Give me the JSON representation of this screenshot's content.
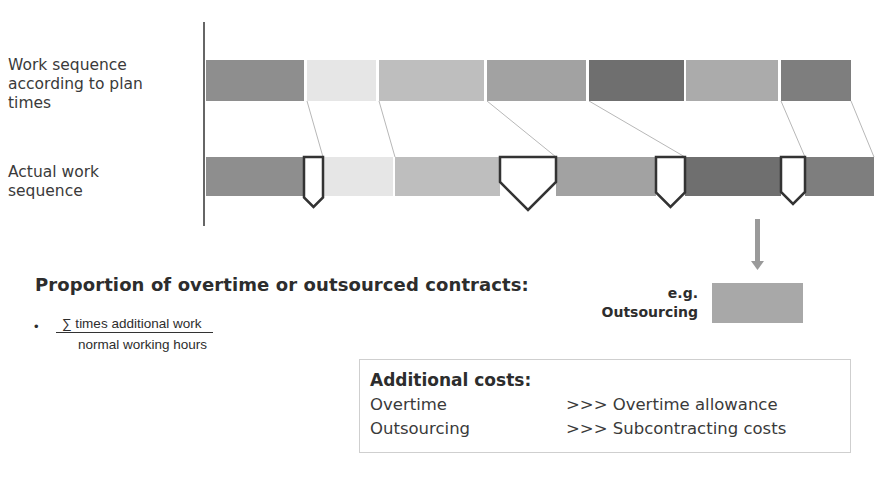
{
  "row_labels": {
    "planned": [
      "Work sequence",
      "according to plan",
      "times"
    ],
    "actual": [
      "Actual work",
      "sequence"
    ]
  },
  "planned_sequence": [
    {
      "x": 206,
      "w": 98,
      "color": "#8e8e8e"
    },
    {
      "x": 307,
      "w": 69,
      "color": "#e6e6e6"
    },
    {
      "x": 379,
      "w": 105,
      "color": "#bebebe"
    },
    {
      "x": 487,
      "w": 99,
      "color": "#a2a2a2"
    },
    {
      "x": 589,
      "w": 95,
      "color": "#6f6f6f"
    },
    {
      "x": 686,
      "w": 92,
      "color": "#ababab"
    },
    {
      "x": 781,
      "w": 70,
      "color": "#7e7e7e"
    }
  ],
  "actual_sequence": [
    {
      "x": 206,
      "w": 98,
      "color": "#8e8e8e"
    },
    {
      "x": 323,
      "w": 70,
      "color": "#e6e6e6"
    },
    {
      "x": 395,
      "w": 105,
      "color": "#bebebe"
    },
    {
      "x": 556,
      "w": 100,
      "color": "#a2a2a2"
    },
    {
      "x": 685,
      "w": 96,
      "color": "#6f6f6f"
    },
    {
      "x": 805,
      "w": 69,
      "color": "#7e7e7e"
    }
  ],
  "additional_work_markers": [
    {
      "x": 304,
      "w": 19,
      "tip": 207
    },
    {
      "x": 500,
      "w": 56,
      "tip": 210
    },
    {
      "x": 656,
      "w": 29,
      "tip": 207
    },
    {
      "x": 781,
      "w": 24,
      "tip": 204
    }
  ],
  "connectors": [
    {
      "x1": 307,
      "y1": 101,
      "x2": 323,
      "y2": 157
    },
    {
      "x1": 379,
      "y1": 101,
      "x2": 395,
      "y2": 157
    },
    {
      "x1": 487,
      "y1": 101,
      "x2": 556,
      "y2": 157
    },
    {
      "x1": 589,
      "y1": 101,
      "x2": 685,
      "y2": 157
    },
    {
      "x1": 781,
      "y1": 101,
      "x2": 805,
      "y2": 157
    },
    {
      "x1": 851,
      "y1": 101,
      "x2": 874,
      "y2": 157
    }
  ],
  "proportion": {
    "heading": "Proportion of overtime or outsourced contracts:",
    "bullet": "•",
    "numerator": "∑ times additional work",
    "denominator": "normal working hours"
  },
  "example": {
    "line1": "e.g.",
    "line2": "Outsourcing",
    "box_color": "#a8a8a8",
    "arrow_color": "#9a9a9a"
  },
  "additional_costs": {
    "title": "Additional costs:",
    "rows": [
      {
        "item": "Overtime",
        "result": ">>> Overtime allowance"
      },
      {
        "item": "Outsourcing",
        "result": ">>> Subcontracting costs"
      }
    ]
  }
}
